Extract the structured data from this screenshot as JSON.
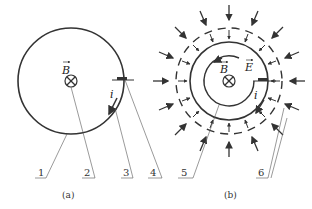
{
  "panel_a": {
    "caption": "(a)",
    "field_label": "B",
    "current_label": "i",
    "callouts": [
      "1",
      "2",
      "3",
      "4"
    ]
  },
  "panel_b": {
    "caption": "(b)",
    "field_label": "B",
    "efield_label": "E",
    "current_label": "i",
    "callouts": [
      "5",
      "6"
    ]
  },
  "colors": {
    "stroke": "#333333",
    "background": "#ffffff"
  }
}
